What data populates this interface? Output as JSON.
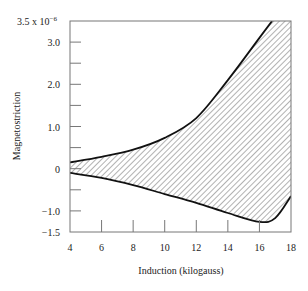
{
  "chart_data": {
    "type": "area",
    "title": "",
    "xlabel": "Induction (kilogauss)",
    "ylabel": "Magnetostriction",
    "y_scale_note": "3.5 x 10^-6",
    "xlim": [
      4,
      18
    ],
    "ylim": [
      -1.5,
      3.5
    ],
    "x_ticks": [
      4,
      6,
      8,
      10,
      12,
      14,
      16,
      18
    ],
    "y_ticks": [
      -1.5,
      -1.0,
      -0.5,
      0,
      0.5,
      1.0,
      1.5,
      2.0,
      2.5,
      3.0,
      3.5
    ],
    "y_tick_labels": [
      {
        "value": 3.5,
        "label": "3.5 x 10"
      },
      {
        "value": 3.0,
        "label": "3.0"
      },
      {
        "value": 2.0,
        "label": "2.0"
      },
      {
        "value": 1.0,
        "label": "1.0"
      },
      {
        "value": 0,
        "label": "0"
      },
      {
        "value": -1.0,
        "label": "−1.0"
      },
      {
        "value": -1.5,
        "label": "−1.5"
      }
    ],
    "y_exponent": "−6",
    "grid": false,
    "legend": null,
    "series": [
      {
        "name": "upper bound",
        "x": [
          4,
          6,
          8,
          10,
          12,
          14,
          16,
          16.8
        ],
        "values": [
          0.15,
          0.28,
          0.45,
          0.73,
          1.2,
          2.1,
          3.1,
          3.5
        ]
      },
      {
        "name": "lower bound",
        "x": [
          4,
          6,
          8,
          10,
          12,
          14,
          16,
          17,
          18
        ],
        "values": [
          -0.1,
          -0.22,
          -0.39,
          -0.6,
          -0.81,
          -1.05,
          -1.26,
          -1.17,
          -0.65
        ]
      }
    ],
    "fill": "hatched region between upper and lower bounds (band extends to right axis at x=18)",
    "colors": {
      "line": "#111111",
      "axis": "#555555",
      "hatch": "#666666"
    }
  }
}
